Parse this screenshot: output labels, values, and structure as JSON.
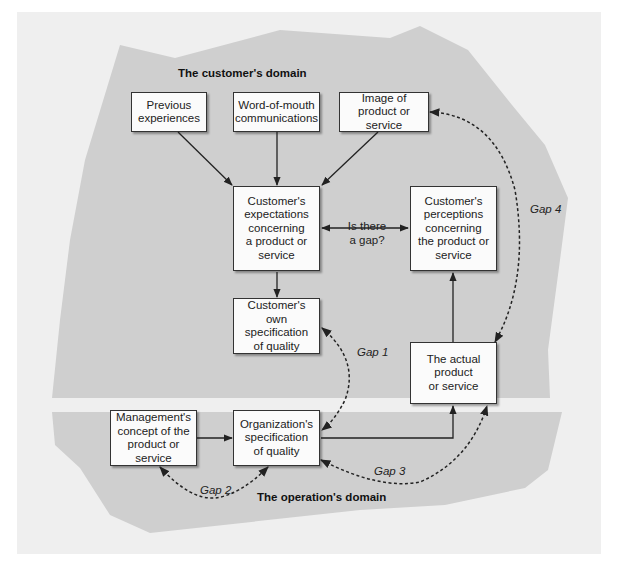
{
  "domains": {
    "customer": "The customer's domain",
    "operation": "The operation's domain"
  },
  "boxes": {
    "previous_experiences": "Previous\nexperiences",
    "word_of_mouth": "Word-of-mouth\ncommunications",
    "image": "Image of\nproduct or service",
    "expectations": "Customer's\nexpectations\nconcerning\na product or\nservice",
    "perceptions": "Customer's\nperceptions\nconcerning\nthe product or\nservice",
    "own_specification": "Customer's own\nspecification\nof quality",
    "actual_product": "The actual\nproduct\nor service",
    "management_concept": "Management's\nconcept of the\nproduct or service",
    "org_specification": "Organization's\nspecification\nof quality"
  },
  "labels": {
    "is_there_gap": "Is there\na gap?"
  },
  "gaps": {
    "gap1": "Gap 1",
    "gap2": "Gap 2",
    "gap3": "Gap 3",
    "gap4": "Gap 4"
  },
  "colors": {
    "panel": "#efefef",
    "domain_shape": "#cfcfcf",
    "box_fill": "#fbfbfb",
    "stroke": "#222222"
  }
}
